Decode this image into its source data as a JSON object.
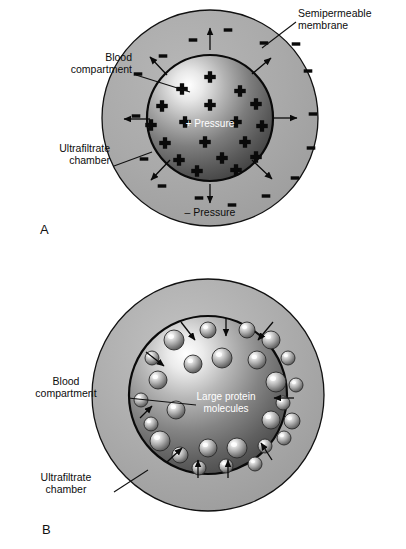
{
  "figure": {
    "background_color": "#ffffff",
    "ink_color": "#0a0a0a",
    "chamber_fill": "#a8a8a8"
  },
  "panels": [
    {
      "id": "A",
      "letter": "A",
      "letter_pos": {
        "x": 40,
        "y": 234
      },
      "outer": {
        "cx": 210,
        "cy": 118,
        "r": 108,
        "label": "ultrafiltrate-chamber"
      },
      "inner": {
        "cx": 210,
        "cy": 118,
        "r": 63,
        "label": "blood-compartment"
      },
      "labels": [
        {
          "name": "semipermeable-membrane-label",
          "lines": [
            "Semipermeable",
            "membrane"
          ],
          "x": 298,
          "y": 17,
          "anchor": "start",
          "leader": [
            [
              296,
              22
            ],
            [
              262,
              48
            ]
          ],
          "color": "#0d0d0d"
        },
        {
          "name": "blood-compartment-label",
          "lines": [
            "Blood",
            "compartment"
          ],
          "x": 132,
          "y": 61,
          "anchor": "end",
          "leader": [
            [
              136,
              75
            ],
            [
              190,
              92
            ]
          ],
          "color": "#0d0d0d"
        },
        {
          "name": "ultrafiltrate-chamber-label",
          "lines": [
            "Ultrafiltrate",
            "chamber"
          ],
          "x": 110,
          "y": 152,
          "anchor": "end",
          "leader": [
            [
              114,
              166
            ],
            [
              152,
              152
            ]
          ],
          "color": "#0d0d0d"
        },
        {
          "name": "positive-pressure-label",
          "lines": [
            "+ Pressure"
          ],
          "x": 210,
          "y": 127,
          "anchor": "middle",
          "leader": null,
          "color": "#ffffff"
        },
        {
          "name": "negative-pressure-label",
          "lines": [
            "– Pressure"
          ],
          "x": 210,
          "y": 216,
          "anchor": "middle",
          "leader": null,
          "color": "#0d0d0d"
        }
      ],
      "plus_marks": [
        {
          "x": 210,
          "y": 77
        },
        {
          "x": 182,
          "y": 89
        },
        {
          "x": 240,
          "y": 91
        },
        {
          "x": 162,
          "y": 106
        },
        {
          "x": 210,
          "y": 105
        },
        {
          "x": 256,
          "y": 104
        },
        {
          "x": 151,
          "y": 125
        },
        {
          "x": 185,
          "y": 122
        },
        {
          "x": 236,
          "y": 122
        },
        {
          "x": 262,
          "y": 126
        },
        {
          "x": 165,
          "y": 143
        },
        {
          "x": 205,
          "y": 142
        },
        {
          "x": 245,
          "y": 142
        },
        {
          "x": 179,
          "y": 160
        },
        {
          "x": 222,
          "y": 158
        },
        {
          "x": 256,
          "y": 157
        },
        {
          "x": 197,
          "y": 171
        },
        {
          "x": 236,
          "y": 170
        }
      ],
      "minus_marks": [
        {
          "x": 228,
          "y": 30
        },
        {
          "x": 193,
          "y": 40
        },
        {
          "x": 264,
          "y": 43
        },
        {
          "x": 163,
          "y": 56
        },
        {
          "x": 296,
          "y": 44
        },
        {
          "x": 138,
          "y": 74
        },
        {
          "x": 308,
          "y": 71
        },
        {
          "x": 136,
          "y": 116
        },
        {
          "x": 313,
          "y": 114
        },
        {
          "x": 144,
          "y": 159
        },
        {
          "x": 311,
          "y": 148
        },
        {
          "x": 162,
          "y": 186
        },
        {
          "x": 295,
          "y": 178
        },
        {
          "x": 199,
          "y": 198
        },
        {
          "x": 266,
          "y": 196
        },
        {
          "x": 232,
          "y": 205
        }
      ],
      "arrows": [
        {
          "x1": 210,
          "y1": 50,
          "x2": 210,
          "y2": 28,
          "name": "flow-arrow-n"
        },
        {
          "x1": 167,
          "y1": 75,
          "x2": 150,
          "y2": 57,
          "name": "flow-arrow-nw"
        },
        {
          "x1": 252,
          "y1": 74,
          "x2": 271,
          "y2": 58,
          "name": "flow-arrow-ne"
        },
        {
          "x1": 150,
          "y1": 119,
          "x2": 124,
          "y2": 119,
          "name": "flow-arrow-w"
        },
        {
          "x1": 272,
          "y1": 118,
          "x2": 297,
          "y2": 118,
          "name": "flow-arrow-e"
        },
        {
          "x1": 170,
          "y1": 160,
          "x2": 151,
          "y2": 180,
          "name": "flow-arrow-sw"
        },
        {
          "x1": 252,
          "y1": 160,
          "x2": 272,
          "y2": 179,
          "name": "flow-arrow-se"
        },
        {
          "x1": 210,
          "y1": 184,
          "x2": 210,
          "y2": 203,
          "name": "flow-arrow-s"
        }
      ]
    },
    {
      "id": "B",
      "letter": "B",
      "letter_pos": {
        "x": 42,
        "y": 534
      },
      "outer": {
        "cx": 208,
        "cy": 395,
        "r": 116,
        "label": "ultrafiltrate-chamber"
      },
      "inner": {
        "cx": 208,
        "cy": 395,
        "r": 79,
        "label": "blood-compartment"
      },
      "labels": [
        {
          "name": "blood-compartment-label",
          "lines": [
            "Blood",
            "compartment"
          ],
          "x": 66,
          "y": 385,
          "anchor": "middle",
          "leader": [
            [
              128,
              398
            ],
            [
              196,
              405
            ]
          ],
          "color": "#0d0d0d"
        },
        {
          "name": "ultrafiltrate-chamber-label",
          "lines": [
            "Ultrafiltrate",
            "chamber"
          ],
          "x": 66,
          "y": 481,
          "anchor": "middle",
          "leader": [
            [
              114,
              492
            ],
            [
              148,
              470
            ]
          ],
          "color": "#0d0d0d"
        },
        {
          "name": "large-protein-molecules-label",
          "lines": [
            "Large protein",
            "molecules"
          ],
          "x": 226,
          "y": 400,
          "anchor": "middle",
          "leader": null,
          "color": "#ffffff"
        }
      ],
      "proteins": [
        {
          "cx": 208,
          "cy": 330,
          "r": 8
        },
        {
          "cx": 247,
          "cy": 330,
          "r": 8
        },
        {
          "cx": 174,
          "cy": 340,
          "r": 10
        },
        {
          "cx": 271,
          "cy": 340,
          "r": 9
        },
        {
          "cx": 152,
          "cy": 358,
          "r": 7
        },
        {
          "cx": 288,
          "cy": 358,
          "r": 7
        },
        {
          "cx": 222,
          "cy": 358,
          "r": 10
        },
        {
          "cx": 257,
          "cy": 360,
          "r": 9
        },
        {
          "cx": 193,
          "cy": 364,
          "r": 9
        },
        {
          "cx": 158,
          "cy": 380,
          "r": 9
        },
        {
          "cx": 276,
          "cy": 382,
          "r": 10
        },
        {
          "cx": 296,
          "cy": 385,
          "r": 7
        },
        {
          "cx": 141,
          "cy": 400,
          "r": 7
        },
        {
          "cx": 283,
          "cy": 403,
          "r": 7
        },
        {
          "cx": 176,
          "cy": 410,
          "r": 9
        },
        {
          "cx": 271,
          "cy": 420,
          "r": 9
        },
        {
          "cx": 292,
          "cy": 421,
          "r": 8
        },
        {
          "cx": 151,
          "cy": 424,
          "r": 7
        },
        {
          "cx": 284,
          "cy": 438,
          "r": 7
        },
        {
          "cx": 160,
          "cy": 441,
          "r": 10
        },
        {
          "cx": 265,
          "cy": 446,
          "r": 7
        },
        {
          "cx": 180,
          "cy": 455,
          "r": 8
        },
        {
          "cx": 208,
          "cy": 448,
          "r": 9
        },
        {
          "cx": 237,
          "cy": 448,
          "r": 10
        },
        {
          "cx": 255,
          "cy": 464,
          "r": 7
        },
        {
          "cx": 199,
          "cy": 468,
          "r": 7
        },
        {
          "cx": 226,
          "cy": 466,
          "r": 7
        }
      ],
      "arrows": [
        {
          "x1": 181,
          "y1": 322,
          "x2": 195,
          "y2": 340,
          "name": "inflow-arrow-nw"
        },
        {
          "x1": 226,
          "y1": 318,
          "x2": 226,
          "y2": 336,
          "name": "inflow-arrow-n"
        },
        {
          "x1": 273,
          "y1": 322,
          "x2": 258,
          "y2": 340,
          "name": "inflow-arrow-ne"
        },
        {
          "x1": 146,
          "y1": 352,
          "x2": 164,
          "y2": 366,
          "name": "inflow-arrow-wnw"
        },
        {
          "x1": 294,
          "y1": 398,
          "x2": 274,
          "y2": 398,
          "name": "inflow-arrow-e"
        },
        {
          "x1": 140,
          "y1": 418,
          "x2": 152,
          "y2": 406,
          "name": "inflow-arrow-w"
        },
        {
          "x1": 167,
          "y1": 462,
          "x2": 182,
          "y2": 448,
          "name": "inflow-arrow-sw"
        },
        {
          "x1": 198,
          "y1": 478,
          "x2": 198,
          "y2": 460,
          "name": "inflow-arrow-s"
        },
        {
          "x1": 228,
          "y1": 478,
          "x2": 228,
          "y2": 460,
          "name": "inflow-arrow-ssE"
        },
        {
          "x1": 272,
          "y1": 460,
          "x2": 261,
          "y2": 443,
          "name": "inflow-arrow-se"
        }
      ]
    }
  ]
}
